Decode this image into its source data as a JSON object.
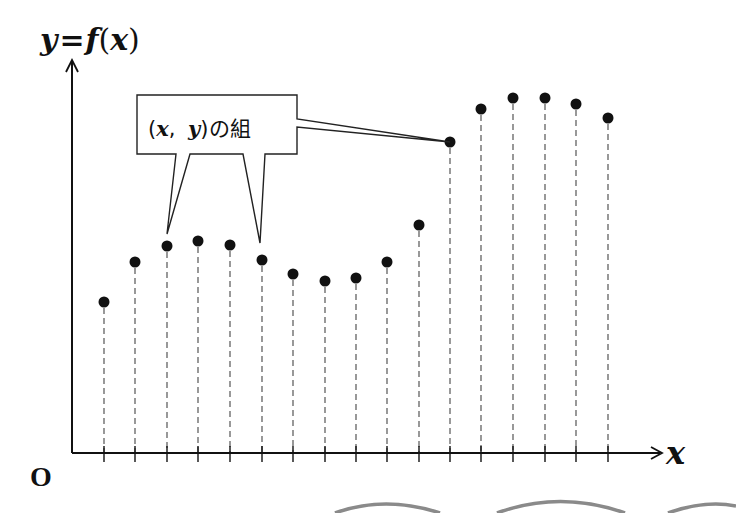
{
  "labels": {
    "y_axis": "y=f(x)",
    "y_axis_parts": [
      "y",
      "=",
      "f",
      "(",
      "x",
      ")"
    ],
    "x_axis": "x",
    "origin": "O",
    "callout": {
      "open": "(",
      "x": "x",
      "comma": ",",
      "y": "y",
      "close": ")",
      "suffix": "の組",
      "full": "(x, y)の組"
    }
  },
  "colors": {
    "ink": "#111111",
    "dashed": "#555555",
    "arc": "#8a8a8a",
    "background": "#ffffff"
  },
  "chart_data": {
    "type": "scatter",
    "title": "y=f(x)",
    "xlabel": "x",
    "ylabel": "y=f(x)",
    "grid": false,
    "x": [
      1,
      2,
      3,
      4,
      5,
      6,
      7,
      8,
      9,
      10,
      11,
      12,
      13,
      14,
      15,
      16,
      17
    ],
    "values": [
      3.9,
      5.0,
      5.4,
      5.5,
      5.4,
      5.0,
      4.6,
      4.4,
      4.5,
      5.0,
      6.0,
      8.2,
      9.1,
      9.4,
      9.4,
      9.3,
      8.9
    ],
    "pixel_points": [
      [
        104,
        302
      ],
      [
        135,
        262
      ],
      [
        167,
        246
      ],
      [
        198,
        241
      ],
      [
        230,
        245
      ],
      [
        262,
        260
      ],
      [
        293,
        274
      ],
      [
        325,
        281
      ],
      [
        356,
        278
      ],
      [
        387,
        262
      ],
      [
        419,
        225
      ],
      [
        450,
        142
      ],
      [
        481,
        109
      ],
      [
        513,
        98
      ],
      [
        545,
        98
      ],
      [
        576,
        104
      ],
      [
        608,
        118
      ]
    ],
    "callout_targets": [
      3,
      6,
      12
    ],
    "annotations": [
      "(x, y)の組"
    ]
  }
}
